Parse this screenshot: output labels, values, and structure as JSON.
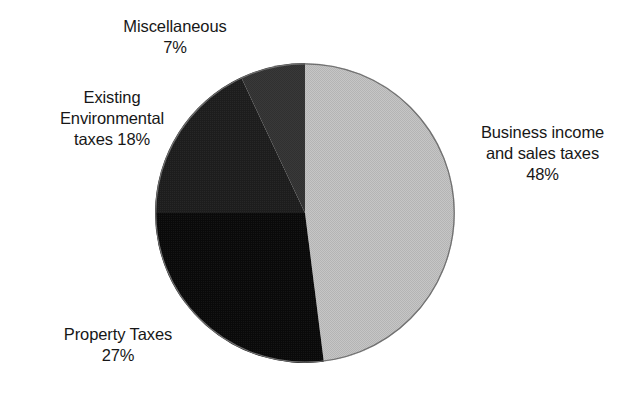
{
  "background_color": "#ffffff",
  "text_color": "#171717",
  "chart_data": {
    "type": "pie",
    "title": "",
    "subtitle": "",
    "xlabel": "",
    "ylabel": "",
    "grid": false,
    "legend_position": "none",
    "label_format": "name + percent",
    "start_angle_deg": 0,
    "direction": "clockwise",
    "center_px": [
      305,
      213
    ],
    "radius_px": 150,
    "units": "percent",
    "total": 100,
    "categories": [
      "Business income and sales taxes",
      "Property Taxes",
      "Existing Environmental taxes",
      "Miscellaneous"
    ],
    "values": [
      48,
      27,
      18,
      7
    ],
    "colors": [
      "#c3c3c3",
      "#0a0a0a",
      "#1d1d1d",
      "#393939"
    ],
    "slices": [
      {
        "name": "Business income and sales taxes",
        "value": 48,
        "percent_text": "48%",
        "color": "#c3c3c3",
        "start_deg": 0,
        "end_deg": 172.8
      },
      {
        "name": "Property Taxes",
        "value": 27,
        "percent_text": "27%",
        "color": "#0a0a0a",
        "start_deg": 172.8,
        "end_deg": 270.0
      },
      {
        "name": "Existing Environmental taxes",
        "value": 18,
        "percent_text": "18%",
        "color": "#1d1d1d",
        "start_deg": 270.0,
        "end_deg": 334.8
      },
      {
        "name": "Miscellaneous",
        "value": 7,
        "percent_text": "7%",
        "color": "#393939",
        "start_deg": 334.8,
        "end_deg": 360.0
      }
    ]
  },
  "labels": {
    "miscellaneous": {
      "line1": "Miscellaneous",
      "line2": "7%"
    },
    "existing_environmental": {
      "line1": "Existing",
      "line2": "Environmental",
      "line3": "taxes 18%"
    },
    "business": {
      "line1": "Business income",
      "line2": "and sales taxes",
      "line3": "48%"
    },
    "property": {
      "line1": "Property Taxes",
      "line2": "27%"
    }
  }
}
